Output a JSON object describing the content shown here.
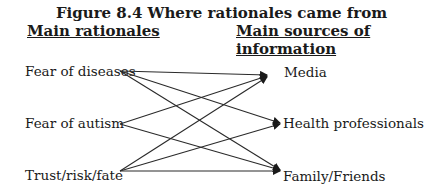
{
  "figure": {
    "title": "Figure 8.4 Where rationales came from",
    "left_header": "Main rationales",
    "right_header": "Main sources of information"
  },
  "rationales": [
    {
      "label": "Fear of diseases"
    },
    {
      "label": "Fear of autism"
    },
    {
      "label": "Trust/risk/fate"
    }
  ],
  "sources": [
    {
      "label": "Media"
    },
    {
      "label": "Health professionals"
    },
    {
      "label": "Family/Friends"
    }
  ],
  "links": [
    {
      "from": "Fear of diseases",
      "to": "Media"
    },
    {
      "from": "Fear of diseases",
      "to": "Health professionals"
    },
    {
      "from": "Fear of diseases",
      "to": "Family/Friends"
    },
    {
      "from": "Fear of autism",
      "to": "Media"
    },
    {
      "from": "Fear of autism",
      "to": "Family/Friends"
    },
    {
      "from": "Trust/risk/fate",
      "to": "Media"
    },
    {
      "from": "Trust/risk/fate",
      "to": "Health professionals"
    },
    {
      "from": "Trust/risk/fate",
      "to": "Family/Friends"
    }
  ]
}
